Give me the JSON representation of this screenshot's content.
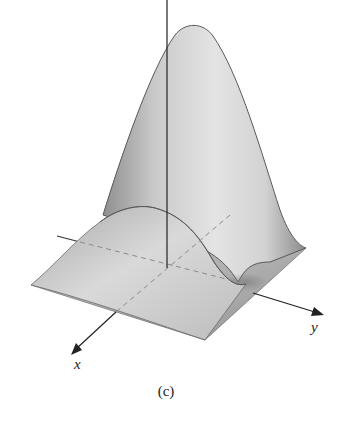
{
  "figure": {
    "caption": "(c)",
    "axes": {
      "x_label": "x",
      "y_label": "y",
      "z_label": ""
    },
    "colors": {
      "background": "#ffffff",
      "surface_light": "#e6e6e6",
      "surface_dark": "#8c8c8c",
      "axis": "#222222",
      "hidden_axis_dashed": "#8a8a8a"
    }
  }
}
